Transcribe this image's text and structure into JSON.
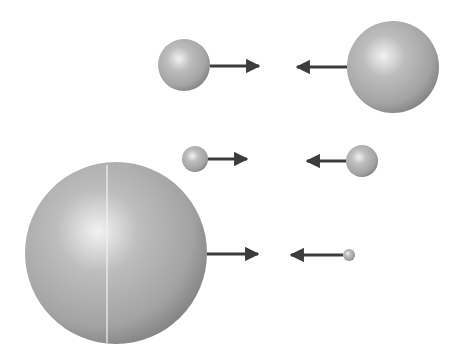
{
  "colors": {
    "background": "#ffffff",
    "sphere_light": "#f2f2f2",
    "sphere_mid": "#a9a9a9",
    "sphere_dark": "#7a7a7a",
    "arrow": "#3c3c3c"
  },
  "pairs": [
    {
      "name": "pair-1",
      "left": {
        "cx": 184,
        "cy": 65,
        "r": 26
      },
      "right": {
        "cx": 393,
        "cy": 67,
        "r": 46
      },
      "left_arrow": {
        "x1": 210,
        "x2": 259,
        "y": 66
      },
      "right_arrow": {
        "x1": 347,
        "x2": 297,
        "y": 67
      }
    },
    {
      "name": "pair-2",
      "left": {
        "cx": 195,
        "cy": 159,
        "r": 13
      },
      "right": {
        "cx": 362,
        "cy": 161,
        "r": 16
      },
      "left_arrow": {
        "x1": 208,
        "x2": 247,
        "y": 159
      },
      "right_arrow": {
        "x1": 346,
        "x2": 307,
        "y": 161
      }
    },
    {
      "name": "pair-3",
      "left": {
        "cx": 116,
        "cy": 253,
        "r": 91
      },
      "right": {
        "cx": 349,
        "cy": 255,
        "r": 6
      },
      "left_arrow": {
        "x1": 207,
        "x2": 258,
        "y": 254
      },
      "right_arrow": {
        "x1": 343,
        "x2": 291,
        "y": 255
      }
    }
  ],
  "divider": {
    "x": 107,
    "y1": 165,
    "y2": 343
  }
}
